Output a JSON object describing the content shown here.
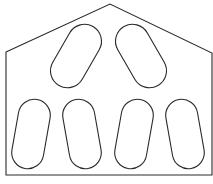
{
  "diagram": {
    "type": "plate-outline-with-slots",
    "stroke_color": "#2a2a2a",
    "background": "#ffffff",
    "outline": {
      "shape": "pentagon (house shape)",
      "points": [
        [
          6,
          52
        ],
        [
          110,
          4
        ],
        [
          212,
          53
        ],
        [
          212,
          175
        ],
        [
          6,
          175
        ]
      ]
    },
    "slots": [
      {
        "id": "top-left",
        "cx": 76,
        "cy": 56,
        "length": 68,
        "width": 34,
        "angle": 30
      },
      {
        "id": "top-right",
        "cx": 141,
        "cy": 56,
        "length": 68,
        "width": 34,
        "angle": -30
      },
      {
        "id": "bottom-1",
        "cx": 31,
        "cy": 134,
        "length": 70,
        "width": 32,
        "angle": 10
      },
      {
        "id": "bottom-2",
        "cx": 82,
        "cy": 134,
        "length": 70,
        "width": 32,
        "angle": -10
      },
      {
        "id": "bottom-3",
        "cx": 134,
        "cy": 134,
        "length": 70,
        "width": 32,
        "angle": 10
      },
      {
        "id": "bottom-4",
        "cx": 185,
        "cy": 134,
        "length": 70,
        "width": 32,
        "angle": -10
      }
    ],
    "caption": ""
  }
}
